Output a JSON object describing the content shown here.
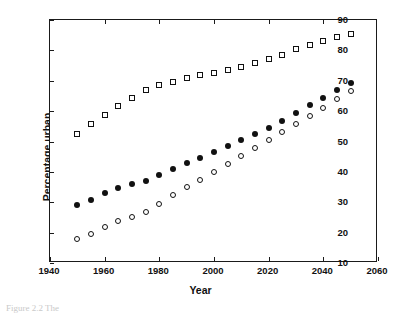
{
  "figure": {
    "caption_fragment": "Figure 2.2  The",
    "background_color": "#ffffff",
    "axis_color": "#111111"
  },
  "chart_data": {
    "type": "scatter",
    "title": "",
    "xlabel": "Year",
    "ylabel": "Percentage urban",
    "xlim": [
      1940,
      2060
    ],
    "ylim": [
      10,
      90
    ],
    "xticks": [
      1940,
      1960,
      1980,
      2000,
      2020,
      2040,
      2060
    ],
    "xtick_labels": [
      "1940",
      "1960",
      "1980",
      "2000",
      "2020",
      "2040",
      "2060"
    ],
    "yticks": [
      10,
      20,
      30,
      40,
      50,
      60,
      70,
      80,
      90
    ],
    "ytick_labels": [
      "10",
      "20",
      "30",
      "40",
      "50",
      "60",
      "70",
      "80",
      "90"
    ],
    "grid": false,
    "legend": "none",
    "x": [
      1950,
      1955,
      1960,
      1965,
      1970,
      1975,
      1980,
      1985,
      1990,
      1995,
      2000,
      2005,
      2010,
      2015,
      2020,
      2025,
      2030,
      2035,
      2040,
      2045,
      2050
    ],
    "series": [
      {
        "name": "More developed regions",
        "marker": "open-square",
        "values": [
          52.6,
          55.7,
          58.6,
          61.6,
          64.3,
          66.8,
          68.6,
          69.7,
          71.0,
          71.9,
          72.7,
          73.5,
          74.5,
          75.8,
          77.2,
          78.6,
          80.3,
          81.7,
          83.1,
          84.3,
          85.3
        ]
      },
      {
        "name": "World",
        "marker": "filled-circle",
        "values": [
          29.1,
          30.9,
          32.9,
          34.6,
          35.9,
          37.1,
          39.0,
          40.8,
          43.0,
          44.6,
          46.6,
          48.5,
          50.5,
          52.6,
          54.6,
          56.9,
          59.3,
          61.9,
          64.3,
          66.8,
          69.1
        ]
      },
      {
        "name": "Less developed regions",
        "marker": "open-circle",
        "values": [
          17.8,
          19.7,
          21.7,
          23.7,
          25.2,
          26.8,
          29.5,
          32.3,
          35.0,
          37.4,
          39.9,
          42.5,
          45.2,
          47.8,
          50.4,
          53.0,
          55.8,
          58.4,
          61.1,
          63.9,
          66.5
        ]
      }
    ]
  }
}
